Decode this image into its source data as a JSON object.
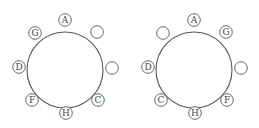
{
  "diagrams": [
    {
      "name": "left-arrangement",
      "center": [
        65,
        70
      ],
      "radius": 38,
      "seats": [
        {
          "pos": "top",
          "x": 65,
          "y": 20,
          "label": "A"
        },
        {
          "pos": "top-right",
          "x": 97,
          "y": 32,
          "label": ""
        },
        {
          "pos": "right",
          "x": 112,
          "y": 68,
          "label": ""
        },
        {
          "pos": "bottom-right",
          "x": 98,
          "y": 100,
          "label": "C"
        },
        {
          "pos": "bottom",
          "x": 66,
          "y": 113,
          "label": "H"
        },
        {
          "pos": "bottom-left",
          "x": 32,
          "y": 100,
          "label": "F"
        },
        {
          "pos": "left",
          "x": 19,
          "y": 67,
          "label": "D"
        },
        {
          "pos": "top-left",
          "x": 35,
          "y": 33,
          "label": "G"
        }
      ]
    },
    {
      "name": "right-arrangement",
      "center": [
        194,
        70
      ],
      "radius": 38,
      "seats": [
        {
          "pos": "top",
          "x": 194,
          "y": 20,
          "label": "A"
        },
        {
          "pos": "top-right",
          "x": 226,
          "y": 32,
          "label": "G"
        },
        {
          "pos": "right",
          "x": 241,
          "y": 68,
          "label": ""
        },
        {
          "pos": "bottom-right",
          "x": 227,
          "y": 100,
          "label": "F"
        },
        {
          "pos": "bottom",
          "x": 195,
          "y": 113,
          "label": "H"
        },
        {
          "pos": "bottom-left",
          "x": 161,
          "y": 100,
          "label": "C"
        },
        {
          "pos": "left",
          "x": 148,
          "y": 67,
          "label": "D"
        },
        {
          "pos": "top-left",
          "x": 163,
          "y": 33,
          "label": ""
        }
      ]
    }
  ],
  "colors": {
    "stroke": "#555555",
    "text": "#444444",
    "background": "#ffffff"
  }
}
